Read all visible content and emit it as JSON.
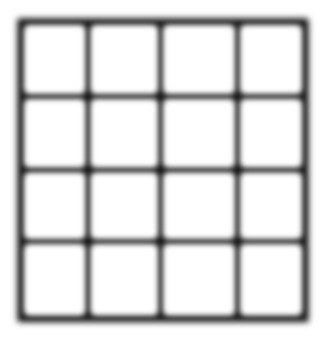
{
  "image": {
    "kind": "abstract-grid-figure",
    "width": 324,
    "height": 339,
    "background_color": "#ffffff",
    "alt_text": "Black 4 by 4 grid of white squares on white background, lines softly blurred"
  },
  "grid": {
    "label": "grid-of-squares",
    "rows": 4,
    "columns": 4,
    "cell_count": 16,
    "line_color": "#0a0a0a",
    "cell_color": "#ffffff",
    "line_thickness_px": 8,
    "blur_radius_px": 3.2,
    "bounds": {
      "left": 18,
      "top": 19,
      "right": 308,
      "bottom": 322
    },
    "vertical_line_centers": [
      21.5,
      88.0,
      160.5,
      237.5,
      304.5
    ],
    "horizontal_line_centers": [
      22.5,
      96.5,
      170.0,
      241.5,
      318.0
    ],
    "cells": [
      {
        "row": 0,
        "col": 0,
        "fill": "#ffffff"
      },
      {
        "row": 0,
        "col": 1,
        "fill": "#ffffff"
      },
      {
        "row": 0,
        "col": 2,
        "fill": "#ffffff"
      },
      {
        "row": 0,
        "col": 3,
        "fill": "#ffffff"
      },
      {
        "row": 1,
        "col": 0,
        "fill": "#ffffff"
      },
      {
        "row": 1,
        "col": 1,
        "fill": "#ffffff"
      },
      {
        "row": 1,
        "col": 2,
        "fill": "#ffffff"
      },
      {
        "row": 1,
        "col": 3,
        "fill": "#ffffff"
      },
      {
        "row": 2,
        "col": 0,
        "fill": "#ffffff"
      },
      {
        "row": 2,
        "col": 1,
        "fill": "#ffffff"
      },
      {
        "row": 2,
        "col": 2,
        "fill": "#ffffff"
      },
      {
        "row": 2,
        "col": 3,
        "fill": "#ffffff"
      },
      {
        "row": 3,
        "col": 0,
        "fill": "#ffffff"
      },
      {
        "row": 3,
        "col": 1,
        "fill": "#ffffff"
      },
      {
        "row": 3,
        "col": 2,
        "fill": "#ffffff"
      },
      {
        "row": 3,
        "col": 3,
        "fill": "#ffffff"
      }
    ]
  }
}
